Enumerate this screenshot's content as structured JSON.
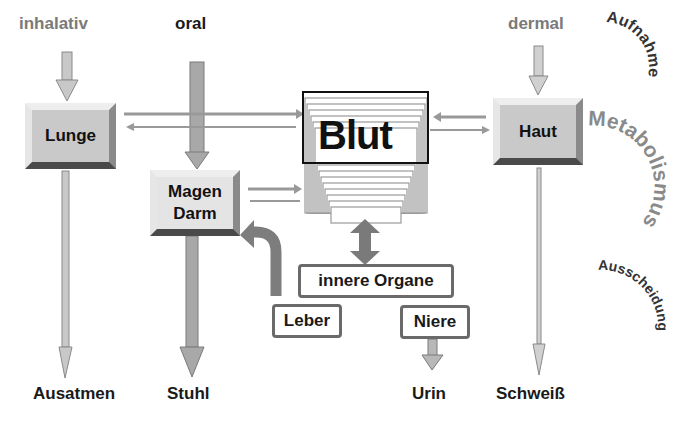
{
  "routes": {
    "inhalativ": "inhalativ",
    "oral": "oral",
    "dermal": "dermal"
  },
  "organs": {
    "lunge": "Lunge",
    "magen_line1": "Magen",
    "magen_line2": "Darm",
    "blut": "Blut",
    "haut": "Haut",
    "innere_organe": "innere Organe",
    "leber": "Leber",
    "niere": "Niere"
  },
  "excretion": {
    "ausatmen": "Ausatmen",
    "stuhl": "Stuhl",
    "urin": "Urin",
    "schweiss": "Schweiß"
  },
  "phases": {
    "aufnahme": "Aufnahme",
    "metabolismus": "Metabolismus",
    "ausscheidung": "Ausscheidung"
  },
  "colors": {
    "arrow_fill": "#b4b4b4",
    "arrow_dark": "#8c8c8c",
    "phase_dark": "#333333",
    "phase_grey": "#8a8a8a"
  }
}
